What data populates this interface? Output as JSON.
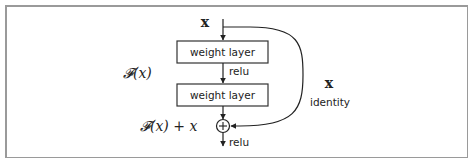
{
  "diagram": {
    "input_label": "x",
    "layers": [
      {
        "label": "weight layer"
      },
      {
        "label": "weight layer"
      }
    ],
    "activation_between": "relu",
    "residual_label_F": "𝓕(x)",
    "identity_x_label": "x",
    "identity_label": "identity",
    "sum_label": "𝓕(x) + x",
    "sum_symbol": "+",
    "output_activation": "relu",
    "colors": {
      "stroke": "#222222",
      "frame": "#9a9a9a",
      "background": "#ffffff"
    }
  }
}
